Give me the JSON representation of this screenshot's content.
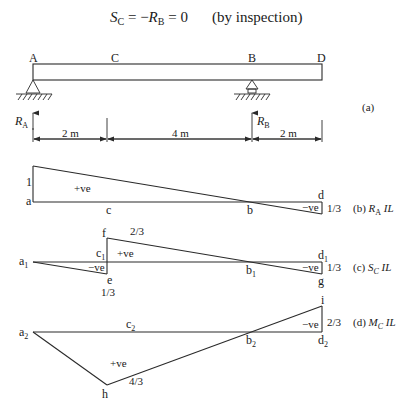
{
  "header": {
    "equation_lhs": "S",
    "equation_lhs_sub": "C",
    "equation_mid": " = −",
    "equation_rb": "R",
    "equation_rb_sub": "B",
    "equation_rhs": " = 0",
    "note": "(by inspection)"
  },
  "beam": {
    "points": [
      "A",
      "C",
      "B",
      "D"
    ],
    "reaction_a": "R",
    "reaction_a_sub": "A",
    "reaction_b": "R",
    "reaction_b_sub": "B",
    "dims": [
      "2 m",
      "4 m",
      "2 m"
    ],
    "caption": "(a)"
  },
  "ra_il": {
    "caption_prefix": "(b) ",
    "caption_sym": "R",
    "caption_sub": "A",
    "caption_suffix": " IL",
    "left_value": "1",
    "right_value": "1/3",
    "pos_label": "+ve",
    "neg_label": "−ve",
    "labels": {
      "a": "a",
      "c": "c",
      "b": "b",
      "d": "d"
    }
  },
  "sc_il": {
    "caption_prefix": "(c) ",
    "caption_sym": "S",
    "caption_sub": "C",
    "caption_suffix": " IL",
    "f_value": "2/3",
    "e_value": "1/3",
    "right_value": "1/3",
    "pos_label": "+ve",
    "neg_label_left": "−ve",
    "neg_label_right": "−ve",
    "labels": {
      "a": "a",
      "a_sub": "1",
      "c": "c",
      "c_sub": "1",
      "b": "b",
      "b_sub": "1",
      "d": "d",
      "d_sub": "1",
      "e": "e",
      "f": "f",
      "g": "g"
    }
  },
  "mc_il": {
    "caption_prefix": "(d) ",
    "caption_sym": "M",
    "caption_sub": "C",
    "caption_suffix": " IL",
    "h_value": "4/3",
    "i_value": "2/3",
    "pos_label": "+ve",
    "neg_label": "−ve",
    "labels": {
      "a": "a",
      "a_sub": "2",
      "c": "c",
      "c_sub": "2",
      "b": "b",
      "b_sub": "2",
      "d": "d",
      "d_sub": "2",
      "h": "h",
      "i": "i"
    }
  }
}
